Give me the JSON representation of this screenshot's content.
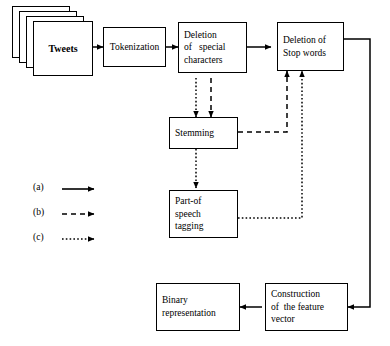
{
  "diagram": {
    "background_color": "#ffffff",
    "line_color": "#000000",
    "nodes": {
      "tweets": {
        "label": "Tweets",
        "shape": "document-stack",
        "sheets": 4
      },
      "tokenization": {
        "lines": [
          "Tokenization"
        ]
      },
      "deletion_special": {
        "lines": [
          "Deletion",
          "of   special",
          "characters"
        ]
      },
      "deletion_stop": {
        "lines": [
          "Deletion of",
          "Stop words"
        ]
      },
      "stemming": {
        "lines": [
          "Stemming"
        ]
      },
      "pos_tagging": {
        "lines": [
          "Part-of",
          "speech",
          "tagging"
        ]
      },
      "construction": {
        "lines": [
          "Construction",
          "of  the feature",
          "vector"
        ]
      },
      "binary": {
        "lines": [
          "Binary",
          "representation"
        ]
      }
    },
    "legend": {
      "items": [
        {
          "key": "(a)",
          "style": "solid"
        },
        {
          "key": "(b)",
          "style": "dashed"
        },
        {
          "key": "(c)",
          "style": "dotted"
        }
      ]
    },
    "edges": [
      {
        "from": "tweets",
        "to": "tokenization",
        "style": "solid"
      },
      {
        "from": "tokenization",
        "to": "deletion_special",
        "style": "solid"
      },
      {
        "from": "deletion_special",
        "to": "deletion_stop",
        "style": "solid"
      },
      {
        "from": "deletion_special",
        "to": "stemming",
        "style": "dotted"
      },
      {
        "from": "deletion_special",
        "to": "stemming",
        "style": "dashed"
      },
      {
        "from": "stemming",
        "to": "deletion_stop",
        "style": "dashed"
      },
      {
        "from": "stemming",
        "to": "pos_tagging",
        "style": "dotted"
      },
      {
        "from": "pos_tagging",
        "to": "deletion_stop",
        "style": "dotted"
      },
      {
        "from": "deletion_stop",
        "to": "construction",
        "style": "solid"
      },
      {
        "from": "construction",
        "to": "binary",
        "style": "solid"
      }
    ]
  }
}
